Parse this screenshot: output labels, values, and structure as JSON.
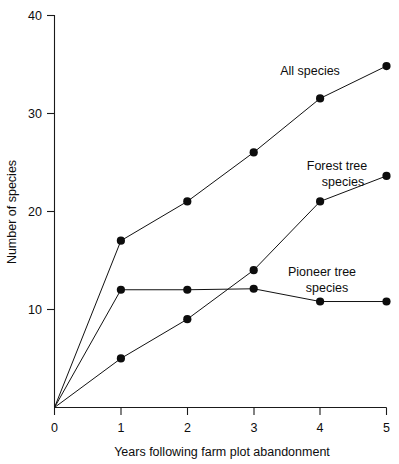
{
  "chart_data": {
    "type": "line",
    "title": "",
    "subtitle": "",
    "xlabel": "Years following farm plot abandonment",
    "ylabel": "Number of species",
    "xlim": [
      0,
      5
    ],
    "ylim": [
      0,
      40
    ],
    "xticks": [
      "0",
      "1",
      "2",
      "3",
      "4",
      "5"
    ],
    "yticks": [
      "10",
      "20",
      "30",
      "40"
    ],
    "grid": false,
    "legend_position": "inline-annotations",
    "x": [
      0,
      1,
      2,
      3,
      4,
      5
    ],
    "series": [
      {
        "name": "All species",
        "label": "All species",
        "values": [
          0,
          17,
          21,
          26,
          31.5,
          34.8
        ],
        "color": "#111111"
      },
      {
        "name": "Forest tree species",
        "label_line1": "Forest tree",
        "label_line2": "species",
        "values": [
          0,
          5,
          9,
          14,
          21,
          23.6
        ],
        "color": "#111111"
      },
      {
        "name": "Pioneer tree species",
        "label_line1": "Pioneer tree",
        "label_line2": "species",
        "values": [
          0,
          12,
          12,
          12.1,
          10.8,
          10.8
        ],
        "color": "#111111"
      }
    ],
    "annotations": [
      {
        "text": "All species",
        "x": 4.1,
        "y": 35.5
      },
      {
        "text": "Forest tree",
        "x": 4.2,
        "y": 25.5
      },
      {
        "text": "species",
        "x": 4.35,
        "y": 23.8
      },
      {
        "text": "Pioneer tree",
        "x": 3.95,
        "y": 13.6
      },
      {
        "text": "species",
        "x": 4.1,
        "y": 11.9
      }
    ]
  },
  "axes": {
    "y_title": "Number of species",
    "x_title": "Years following farm plot abandonment",
    "y_tick_40": "40",
    "y_tick_30": "30",
    "y_tick_20": "20",
    "y_tick_10": "10",
    "x_tick_0": "0",
    "x_tick_1": "1",
    "x_tick_2": "2",
    "x_tick_3": "3",
    "x_tick_4": "4",
    "x_tick_5": "5"
  },
  "labels": {
    "all_species": "All species",
    "forest_tree_1": "Forest tree",
    "forest_tree_2": "species",
    "pioneer_tree_1": "Pioneer tree",
    "pioneer_tree_2": "species"
  }
}
